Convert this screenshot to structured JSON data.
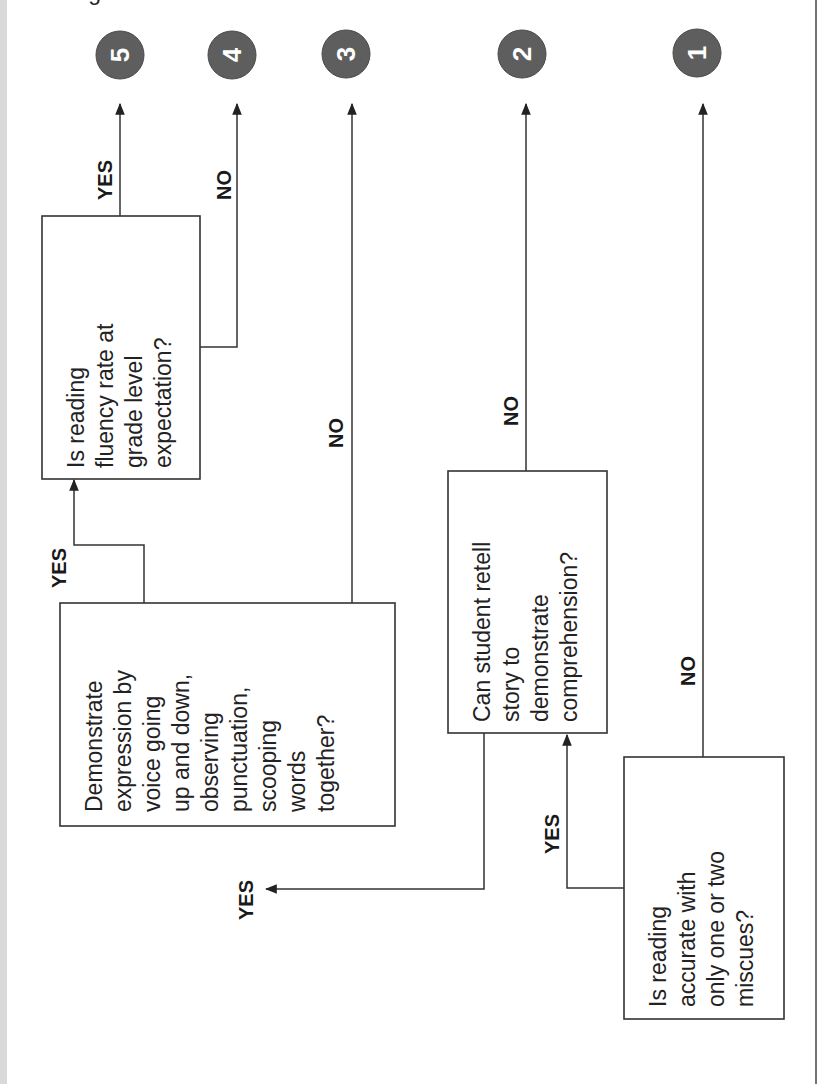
{
  "diagram": {
    "orientation": "rotated-90-ccw",
    "colors": {
      "circle_fill": "#5e5e5e",
      "line": "#333333",
      "background": "#ffffff",
      "left_strip": "#d9d9d9"
    },
    "outcomes": [
      {
        "id": "5",
        "label": "5"
      },
      {
        "id": "4",
        "label": "4"
      },
      {
        "id": "3",
        "label": "3"
      },
      {
        "id": "2",
        "label": "2"
      },
      {
        "id": "1",
        "label": "1"
      }
    ],
    "decisions": {
      "accuracy": {
        "lines": [
          "Is reading",
          "accurate with",
          "only one or two",
          "miscues?"
        ]
      },
      "retell": {
        "lines": [
          "Can student retell",
          "story to",
          "demonstrate",
          "comprehension?"
        ]
      },
      "expression": {
        "lines": [
          "Demonstrate",
          "expression by",
          "voice going",
          "up and down,",
          "observing",
          "punctuation,",
          "scooping",
          "words",
          "together?"
        ]
      },
      "fluency": {
        "lines": [
          "Is reading",
          "fluency rate at",
          "grade level",
          "expectation?"
        ]
      }
    },
    "edge_labels": {
      "fluency_yes": "YES",
      "fluency_no": "NO",
      "expression_yes": "YES",
      "expression_no": "NO",
      "retell_yes": "YES",
      "retell_no": "NO",
      "accuracy_yes": "YES",
      "accuracy_no": "NO"
    }
  }
}
